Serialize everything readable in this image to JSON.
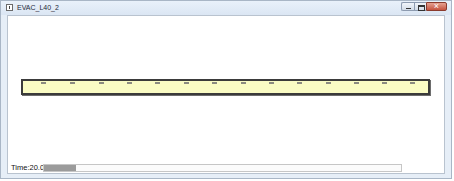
{
  "window": {
    "title": "EVAC_L40_2",
    "buttons": [
      "minimize",
      "maximize",
      "close"
    ],
    "close_button_color": "#c5533f"
  },
  "simulation": {
    "track_fill_color": "#fafcc4",
    "track_border_color": "#3b3b3b",
    "tick_count": 14,
    "tick_positions_px": [
      40,
      69,
      98,
      126,
      154,
      183,
      211,
      240,
      268,
      296,
      325,
      353,
      381,
      409
    ]
  },
  "status": {
    "time_label": "Time:20.0",
    "progress_percent": 9,
    "progress_fill_color": "#9b9b9b"
  }
}
